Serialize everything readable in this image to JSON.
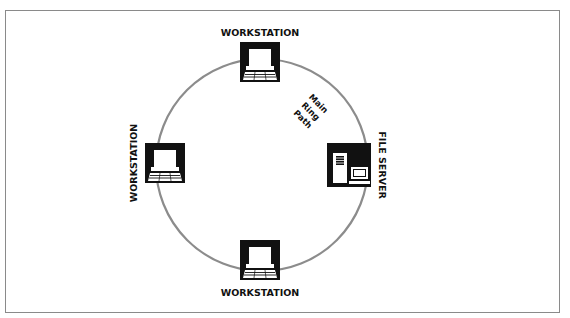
{
  "diagram": {
    "type": "token-ring-network",
    "ring": {
      "label_lines": [
        "Main",
        "Ring",
        "Path"
      ],
      "color": "#8c8c8c"
    },
    "nodes": [
      {
        "id": "top",
        "kind": "workstation",
        "label": "WORKSTATION",
        "icon": "workstation-icon"
      },
      {
        "id": "left",
        "kind": "workstation",
        "label": "WORKSTATION",
        "icon": "workstation-icon"
      },
      {
        "id": "bottom",
        "kind": "workstation",
        "label": "WORKSTATION",
        "icon": "workstation-icon"
      },
      {
        "id": "right",
        "kind": "file-server",
        "label": "FILE SERVER",
        "icon": "file-server-icon"
      }
    ],
    "colors": {
      "icon": "#111111",
      "border": "#8a8a8a",
      "background": "#ffffff"
    }
  }
}
